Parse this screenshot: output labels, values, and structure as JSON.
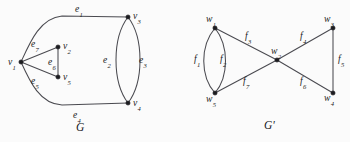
{
  "figure": {
    "width": 350,
    "height": 142,
    "background_color": "#fbfbfb",
    "stroke_color": "#4a4a50",
    "vertex_color": "#1c1c20",
    "text_color": "#1d1d22"
  },
  "graphs": [
    {
      "id": "G",
      "caption": "G",
      "caption_x": 76,
      "caption_y": 122,
      "vertices": [
        {
          "id": "v1",
          "base": "v",
          "sub": "1",
          "x": 21,
          "y": 62,
          "label_x": 8,
          "label_y": 57
        },
        {
          "id": "v2",
          "base": "v",
          "sub": "2",
          "x": 58,
          "y": 47,
          "label_x": 63,
          "label_y": 41
        },
        {
          "id": "v3",
          "base": "v",
          "sub": "3",
          "x": 128,
          "y": 17,
          "label_x": 133,
          "label_y": 11
        },
        {
          "id": "v4",
          "base": "v",
          "sub": "4",
          "x": 128,
          "y": 103,
          "label_x": 133,
          "label_y": 98
        },
        {
          "id": "v5",
          "base": "v",
          "sub": "5",
          "x": 58,
          "y": 77,
          "label_x": 63,
          "label_y": 72
        }
      ],
      "edges": [
        {
          "id": "e1",
          "base": "e",
          "sub": "1",
          "from": "v1",
          "to": "v3",
          "shape": "curve-top",
          "label_x": 75,
          "label_y": 4
        },
        {
          "id": "e2",
          "base": "e",
          "sub": "2",
          "from": "v3",
          "to": "v4",
          "shape": "arc-left",
          "label_x": 103,
          "label_y": 55
        },
        {
          "id": "e3",
          "base": "e",
          "sub": "3",
          "from": "v3",
          "to": "v4",
          "shape": "arc-right",
          "label_x": 139,
          "label_y": 55
        },
        {
          "id": "e4",
          "base": "e",
          "sub": "4",
          "from": "v1",
          "to": "v4",
          "shape": "curve-bottom",
          "label_x": 73,
          "label_y": 110
        },
        {
          "id": "e5",
          "base": "e",
          "sub": "5",
          "from": "v1",
          "to": "v5",
          "shape": "straight",
          "label_x": 31,
          "label_y": 76
        },
        {
          "id": "e6",
          "base": "e",
          "sub": "6",
          "from": "v2",
          "to": "v5",
          "shape": "straight",
          "label_x": 48,
          "label_y": 57
        },
        {
          "id": "e7",
          "base": "e",
          "sub": "7",
          "from": "v1",
          "to": "v2",
          "shape": "straight",
          "label_x": 31,
          "label_y": 39
        }
      ]
    },
    {
      "id": "Gp",
      "caption": "G'",
      "caption_x": 264,
      "caption_y": 120,
      "vertices": [
        {
          "id": "w1",
          "base": "w",
          "sub": "1",
          "x": 215,
          "y": 28,
          "label_x": 206,
          "label_y": 14
        },
        {
          "id": "w2",
          "base": "w",
          "sub": "2",
          "x": 277,
          "y": 60,
          "label_x": 271,
          "label_y": 46
        },
        {
          "id": "w3",
          "base": "w",
          "sub": "3",
          "x": 333,
          "y": 28,
          "label_x": 324,
          "label_y": 14
        },
        {
          "id": "w4",
          "base": "w",
          "sub": "4",
          "x": 333,
          "y": 93,
          "label_x": 324,
          "label_y": 93
        },
        {
          "id": "w5",
          "base": "w",
          "sub": "5",
          "x": 215,
          "y": 93,
          "label_x": 206,
          "label_y": 94
        }
      ],
      "edges": [
        {
          "id": "f1",
          "base": "f",
          "sub": "1",
          "from": "w1",
          "to": "w5",
          "shape": "arc-left",
          "label_x": 194,
          "label_y": 54
        },
        {
          "id": "f2",
          "base": "f",
          "sub": "2",
          "from": "w1",
          "to": "w5",
          "shape": "arc-right",
          "label_x": 220,
          "label_y": 54
        },
        {
          "id": "f3",
          "base": "f",
          "sub": "3",
          "from": "w1",
          "to": "w2",
          "shape": "straight",
          "label_x": 245,
          "label_y": 31
        },
        {
          "id": "f4",
          "base": "f",
          "sub": "4",
          "from": "w2",
          "to": "w3",
          "shape": "straight",
          "label_x": 300,
          "label_y": 31
        },
        {
          "id": "f5",
          "base": "f",
          "sub": "5",
          "from": "w3",
          "to": "w4",
          "shape": "straight",
          "label_x": 338,
          "label_y": 54
        },
        {
          "id": "f6",
          "base": "f",
          "sub": "6",
          "from": "w2",
          "to": "w4",
          "shape": "straight",
          "label_x": 300,
          "label_y": 76
        },
        {
          "id": "f7",
          "base": "f",
          "sub": "7",
          "from": "w2",
          "to": "w5",
          "shape": "straight",
          "label_x": 243,
          "label_y": 76
        }
      ]
    }
  ]
}
